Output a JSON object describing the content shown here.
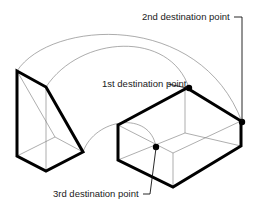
{
  "diagram": {
    "labels": {
      "first": "1st destination point",
      "second": "2nd destination point",
      "third": "3rd destination point"
    },
    "colors": {
      "edge": "#000000",
      "arc": "#888888",
      "hidden_edge": "#777777",
      "text": "#1a1a1a",
      "background": "#ffffff"
    },
    "objects": [
      {
        "name": "wedge",
        "description": "source wedge solid"
      },
      {
        "name": "box",
        "description": "destination box solid"
      }
    ],
    "points": [
      {
        "name": "1st destination point",
        "x": 189,
        "y": 88
      },
      {
        "name": "2nd destination point",
        "x": 242,
        "y": 122
      },
      {
        "name": "3rd destination point",
        "x": 156,
        "y": 147
      }
    ]
  }
}
